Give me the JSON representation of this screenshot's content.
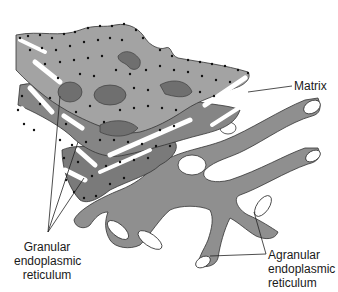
{
  "diagram": {
    "type": "anatomical-illustration",
    "subject": "endoplasmic reticulum",
    "colors": {
      "background": "#ffffff",
      "membrane_light": "#a9a9a9",
      "membrane_mid": "#8c8c8c",
      "membrane_dark": "#6e6e6e",
      "lumen_opening": "#ffffff",
      "ribosome": "#111111",
      "leader_line": "#222222",
      "text": "#1a1a1a"
    },
    "labels": {
      "matrix": "Matrix",
      "granular_line1": "Granular",
      "granular_line2": "endoplasmic",
      "granular_line3": "reticulum",
      "agranular_line1": "Agranular",
      "agranular_line2": "endoplasmic",
      "agranular_line3": "reticulum"
    }
  }
}
